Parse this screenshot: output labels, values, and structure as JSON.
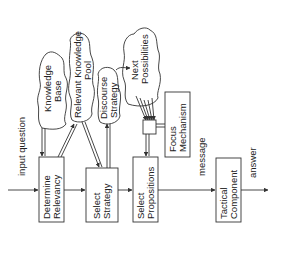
{
  "diagram": {
    "type": "flow-diagram",
    "orientation": "rotated-90-ccw",
    "flow": {
      "input_label": "input question",
      "message_label": "message",
      "answer_label": "answer"
    },
    "boxes": [
      {
        "id": "determine-relevancy",
        "line1": "Determine",
        "line2": "Relevancy"
      },
      {
        "id": "select-strategy",
        "line1": "Select",
        "line2": "Strategy"
      },
      {
        "id": "select-propositions",
        "line1": "Select",
        "line2": "Propositions"
      },
      {
        "id": "tactical-component",
        "line1": "Tactical",
        "line2": "Component"
      },
      {
        "id": "focus-mechanism",
        "line1": "Focus",
        "line2": "Mechanism"
      }
    ],
    "clouds": [
      {
        "id": "knowledge-base",
        "line1": "Knowledge",
        "line2": "Base"
      },
      {
        "id": "relevant-knowledge-pool",
        "line1": "Relevant Knowledge",
        "line2": "Pool"
      },
      {
        "id": "discourse-strategy",
        "line1": "Discourse",
        "line2": "Strategy"
      },
      {
        "id": "next-possibilities",
        "line1": "Next",
        "line2": "Possibilities"
      }
    ],
    "colors": {
      "ink": "#333333",
      "background": "#ffffff"
    }
  }
}
